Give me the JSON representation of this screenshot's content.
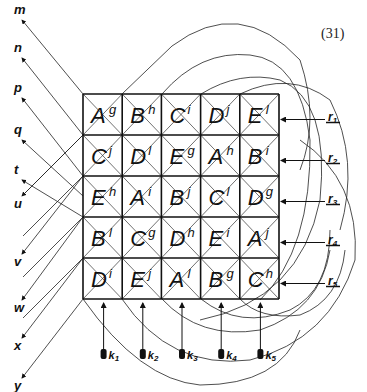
{
  "equation_number": "(31)",
  "grid": {
    "rows": 5,
    "cols": 5,
    "cells": [
      [
        {
          "cap": "A",
          "sup": "g"
        },
        {
          "cap": "B",
          "sup": "h"
        },
        {
          "cap": "C",
          "sup": "i"
        },
        {
          "cap": "D",
          "sup": "j"
        },
        {
          "cap": "E",
          "sup": "l"
        }
      ],
      [
        {
          "cap": "C",
          "sup": "j"
        },
        {
          "cap": "D",
          "sup": "l"
        },
        {
          "cap": "E",
          "sup": "g"
        },
        {
          "cap": "A",
          "sup": "h"
        },
        {
          "cap": "B",
          "sup": "i"
        }
      ],
      [
        {
          "cap": "E",
          "sup": "h"
        },
        {
          "cap": "A",
          "sup": "i"
        },
        {
          "cap": "B",
          "sup": "j"
        },
        {
          "cap": "C",
          "sup": "l"
        },
        {
          "cap": "D",
          "sup": "g"
        }
      ],
      [
        {
          "cap": "B",
          "sup": "l"
        },
        {
          "cap": "C",
          "sup": "g"
        },
        {
          "cap": "D",
          "sup": "h"
        },
        {
          "cap": "E",
          "sup": "i"
        },
        {
          "cap": "A",
          "sup": "j"
        }
      ],
      [
        {
          "cap": "D",
          "sup": "i"
        },
        {
          "cap": "E",
          "sup": "j"
        },
        {
          "cap": "A",
          "sup": "l"
        },
        {
          "cap": "B",
          "sup": "g"
        },
        {
          "cap": "C",
          "sup": "h"
        }
      ]
    ]
  },
  "left_labels": [
    "m",
    "n",
    "p",
    "q",
    "t",
    "u",
    "v",
    "w",
    "x",
    "y"
  ],
  "bottom_labels": [
    "k1",
    "k2",
    "k3",
    "k4",
    "k5"
  ],
  "right_labels": [
    "r1",
    "r2",
    "r3",
    "r4",
    "r5"
  ],
  "colors": {
    "ink": "#111111",
    "background": "#ffffff"
  }
}
